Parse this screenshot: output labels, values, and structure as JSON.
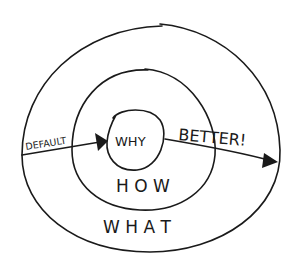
{
  "diagram": {
    "rings": {
      "inner": {
        "label": "WHY"
      },
      "middle": {
        "label": "H O W"
      },
      "outer": {
        "label": "W H A T"
      }
    },
    "arrows": {
      "default": {
        "label": "DEFAULT"
      },
      "better": {
        "label": "BETTER!"
      }
    },
    "colors": {
      "ink": "#1a1a1a",
      "background": "#ffffff"
    }
  }
}
